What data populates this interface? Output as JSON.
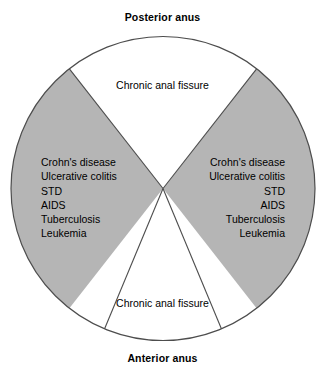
{
  "figure": {
    "type": "anatomical-clock-diagram",
    "background_color": "#ffffff",
    "outline_color": "#4d4d4d",
    "shaded_sector_color": "#b5b5b5",
    "unshaded_sector_color": "#ffffff"
  },
  "axis_labels": {
    "top": "Posterior anus",
    "bottom": "Anterior anus"
  },
  "sectors": {
    "top": {
      "name": "posterior-midline-sector",
      "fill": "#ffffff",
      "label": "Chronic anal fissure"
    },
    "bottom": {
      "name": "anterior-midline-sector",
      "fill": "#ffffff",
      "label": "Chronic anal fissure"
    },
    "left": {
      "name": "left-lateral-sector",
      "fill": "#b5b5b5",
      "align": "left",
      "conditions": [
        "Crohn's disease",
        "Ulcerative colitis",
        "STD",
        "AIDS",
        "Tuberculosis",
        "Leukemia"
      ]
    },
    "right": {
      "name": "right-lateral-sector",
      "fill": "#b5b5b5",
      "align": "right",
      "conditions": [
        "Crohn's disease",
        "Ulcerative colitis",
        "STD",
        "AIDS",
        "Tuberculosis",
        "Leukemia"
      ]
    }
  }
}
